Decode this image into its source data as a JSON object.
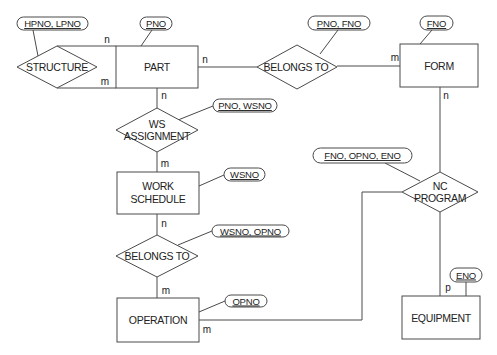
{
  "diagram": {
    "type": "entity-relationship",
    "entities": {
      "part": {
        "label": "PART"
      },
      "form": {
        "label": "FORM"
      },
      "work_schedule": {
        "line1": "WORK",
        "line2": "SCHEDULE"
      },
      "operation": {
        "label": "OPERATION"
      },
      "equipment": {
        "label": "EQUIPMENT"
      }
    },
    "relationships": {
      "structure": {
        "label": "STRUCTURE"
      },
      "belongs_to_form": {
        "label": "BELONGS TO"
      },
      "ws_assignment": {
        "line1": "WS",
        "line2": "ASSIGNMENT"
      },
      "belongs_to_operation": {
        "label": "BELONGS TO"
      },
      "nc_program": {
        "line1": "NC",
        "line2": "PROGRAM"
      }
    },
    "attributes": {
      "structure_key": "HPNO, LPNO",
      "part_key": "PNO",
      "belongs_to_form_key": "PNO, FNO",
      "form_key": "FNO",
      "ws_assignment_key": "PNO, WSNO",
      "work_schedule_key": "WSNO",
      "nc_program_key": "FNO, OPNO, ENO",
      "belongs_to_operation_key": "WSNO, OPNO",
      "operation_key": "OPNO",
      "equipment_key": "ENO"
    },
    "cardinalities": {
      "structure_part_top": "n",
      "structure_part_bottom": "m",
      "part_belongs_to": "n",
      "form_belongs_to": "m",
      "part_ws_assignment": "n",
      "work_schedule_ws_assignment": "m",
      "work_schedule_belongs_to": "n",
      "operation_belongs_to": "m",
      "form_nc_program": "n",
      "operation_nc_program": "m",
      "equipment_nc_program": "p"
    }
  }
}
